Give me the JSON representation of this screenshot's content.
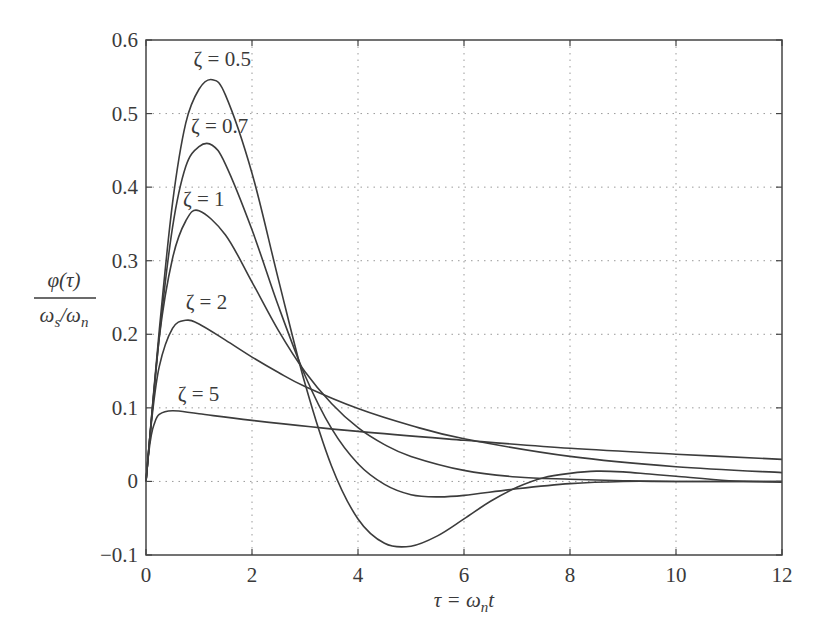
{
  "chart_data": {
    "type": "line",
    "title": "",
    "xlabel": "τ = ω_n t",
    "ylabel": "φ(τ) / (ω_s/ω_n)",
    "ylabel_numerator": "φ(τ)",
    "ylabel_denominator": "ωs/ωn",
    "xlim": [
      0,
      12
    ],
    "ylim": [
      -0.1,
      0.6
    ],
    "grid": true,
    "legend_position": "inline annotations",
    "x_ticks": [
      0,
      2,
      4,
      6,
      8,
      10,
      12
    ],
    "x_tick_labels": [
      "0",
      "2",
      "4",
      "6",
      "8",
      "10",
      "12"
    ],
    "y_ticks": [
      -0.1,
      0,
      0.1,
      0.2,
      0.3,
      0.4,
      0.5,
      0.6
    ],
    "y_tick_labels": [
      "−0.1",
      "0",
      "0.1",
      "0.2",
      "0.3",
      "0.4",
      "0.5",
      "0.6"
    ],
    "series": [
      {
        "name": "ζ = 0.5",
        "label_pos": [
          1.2,
          0.565
        ],
        "x": [
          0,
          0.25,
          0.5,
          0.75,
          1,
          1.25,
          1.5,
          2,
          2.5,
          3,
          3.5,
          4,
          4.5,
          5,
          5.5,
          6,
          6.5,
          7,
          7.5,
          8,
          8.5,
          9,
          9.5,
          10,
          11,
          12
        ],
        "values": [
          0,
          0.205,
          0.378,
          0.487,
          0.533,
          0.546,
          0.525,
          0.419,
          0.274,
          0.133,
          0.021,
          -0.051,
          -0.084,
          -0.088,
          -0.074,
          -0.051,
          -0.027,
          -0.008,
          0.005,
          0.011,
          0.014,
          0.013,
          0.01,
          0.007,
          0.001,
          -0.001
        ]
      },
      {
        "name": "ζ = 0.7",
        "label_pos": [
          1.15,
          0.473
        ],
        "x": [
          0,
          0.25,
          0.5,
          0.75,
          1,
          1.25,
          1.5,
          2,
          2.5,
          3,
          3.5,
          4,
          4.5,
          5,
          5.5,
          6,
          7,
          8,
          9,
          10,
          12
        ],
        "values": [
          0,
          0.196,
          0.345,
          0.428,
          0.455,
          0.457,
          0.431,
          0.342,
          0.238,
          0.144,
          0.072,
          0.024,
          -0.004,
          -0.018,
          -0.021,
          -0.019,
          -0.01,
          -0.003,
          0,
          0,
          0
        ]
      },
      {
        "name": "ζ = 1",
        "label_pos": [
          1.0,
          0.375
        ],
        "x": [
          0,
          0.25,
          0.5,
          0.75,
          1,
          1.5,
          2,
          2.5,
          3,
          3.5,
          4,
          4.5,
          5,
          6,
          7,
          8,
          9,
          10,
          12
        ],
        "values": [
          0,
          0.195,
          0.303,
          0.354,
          0.368,
          0.335,
          0.271,
          0.205,
          0.149,
          0.106,
          0.073,
          0.05,
          0.034,
          0.015,
          0.006,
          0.003,
          0.001,
          0,
          0
        ]
      },
      {
        "name": "ζ = 2",
        "label_pos": [
          1.05,
          0.235
        ],
        "x": [
          0,
          0.1,
          0.25,
          0.5,
          0.75,
          1,
          1.5,
          2,
          2.5,
          3,
          4,
          5,
          6,
          8,
          10,
          12
        ],
        "values": [
          0,
          0.079,
          0.156,
          0.208,
          0.219,
          0.214,
          0.192,
          0.169,
          0.148,
          0.129,
          0.099,
          0.076,
          0.058,
          0.034,
          0.02,
          0.012
        ]
      },
      {
        "name": "ζ = 5",
        "label_pos": [
          0.9,
          0.11
        ],
        "x": [
          0,
          0.05,
          0.1,
          0.15,
          0.25,
          0.5,
          1,
          2,
          4,
          6,
          8,
          10,
          12
        ],
        "values": [
          0,
          0.038,
          0.063,
          0.077,
          0.091,
          0.096,
          0.092,
          0.083,
          0.068,
          0.056,
          0.045,
          0.037,
          0.03
        ]
      }
    ]
  },
  "colors": {
    "curve": "#3c3c3c",
    "grid": "#9a9a9a",
    "frame": "#444444",
    "text": "#3a3a3a"
  }
}
